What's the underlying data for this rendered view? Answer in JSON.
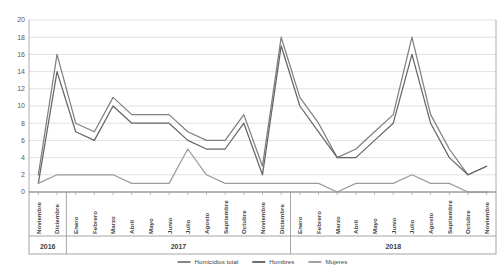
{
  "chart_data": {
    "type": "line",
    "title": "",
    "xlabel": "",
    "ylabel": "",
    "ylim": [
      0,
      20
    ],
    "ytick_step": 2,
    "yticks": [
      0,
      2,
      4,
      6,
      8,
      10,
      12,
      14,
      16,
      18,
      20
    ],
    "grid": true,
    "legend_position": "bottom",
    "categories": [
      "Noviembre",
      "Diciembre",
      "Enero",
      "Febrero",
      "Marzo",
      "Abril",
      "Mayo",
      "Junio",
      "Julio",
      "Agosto",
      "Septiembre",
      "Octubre",
      "Noviembre",
      "Diciembre",
      "Enero",
      "Febrero",
      "Marzo",
      "Abril",
      "Mayo",
      "Junio",
      "Julio",
      "Agosto",
      "Septiembre",
      "Octubre",
      "Noviembre"
    ],
    "year_groups": [
      {
        "label": "2016",
        "count": 2
      },
      {
        "label": "2017",
        "count": 12
      },
      {
        "label": "2018",
        "count": 11
      }
    ],
    "series": [
      {
        "name": "Homicidios total",
        "color": "#808080",
        "values": [
          2,
          16,
          8,
          7,
          11,
          9,
          9,
          9,
          7,
          6,
          6,
          9,
          3,
          18,
          11,
          8,
          4,
          5,
          7,
          9,
          18,
          9,
          5,
          2,
          3
        ]
      },
      {
        "name": "Hombres",
        "color": "#666666",
        "values": [
          1,
          14,
          7,
          6,
          10,
          8,
          8,
          8,
          6,
          5,
          5,
          8,
          2,
          17,
          10,
          7,
          4,
          4,
          6,
          8,
          16,
          8,
          4,
          2,
          3
        ]
      },
      {
        "name": "Mujeres",
        "color": "#9c9c9c",
        "values": [
          1,
          2,
          2,
          2,
          2,
          1,
          1,
          1,
          5,
          2,
          1,
          1,
          1,
          1,
          1,
          1,
          0,
          1,
          1,
          1,
          2,
          1,
          1,
          0,
          0
        ]
      }
    ]
  },
  "legend": {
    "items": [
      {
        "label": "Homicidios total"
      },
      {
        "label": "Hombres"
      },
      {
        "label": "Mujeres"
      }
    ]
  }
}
